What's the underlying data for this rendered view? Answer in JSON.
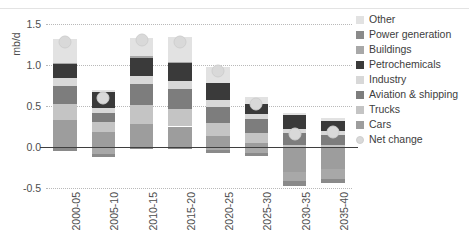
{
  "chart_data": {
    "type": "bar",
    "title": "",
    "subtitle": "",
    "xlabel": "",
    "ylabel": "mb/d",
    "ylim": [
      -0.5,
      1.5
    ],
    "yticks": [
      "1.5",
      "1.0",
      "0.5",
      "0.0",
      "-0.5"
    ],
    "ytick_values": [
      1.5,
      1.0,
      0.5,
      0.0,
      -0.5
    ],
    "grid": true,
    "stacked": true,
    "legend_position": "right",
    "categories": [
      "2000-05",
      "2005-10",
      "2010-15",
      "2015-20",
      "2020-25",
      "2025-30",
      "2030-35",
      "2035-40"
    ],
    "series": [
      {
        "name": "Cars",
        "color": "#9d9d9d",
        "values": [
          0.33,
          0.18,
          0.28,
          0.25,
          0.13,
          0.05,
          -0.3,
          -0.27
        ]
      },
      {
        "name": "Trucks",
        "color": "#c4c4c4",
        "values": [
          0.2,
          0.13,
          0.23,
          0.21,
          0.16,
          0.12,
          0.02,
          0.02
        ]
      },
      {
        "name": "Aviation & shipping",
        "color": "#7d7d7d",
        "values": [
          0.21,
          0.1,
          0.26,
          0.25,
          0.2,
          0.17,
          0.15,
          0.13
        ]
      },
      {
        "name": "Industry",
        "color": "#d8d8d8",
        "values": [
          0.1,
          0.07,
          0.1,
          0.09,
          0.08,
          0.06,
          0.05,
          0.04
        ]
      },
      {
        "name": "Petrochemicals",
        "color": "#3a3a3a",
        "values": [
          0.17,
          0.19,
          0.22,
          0.22,
          0.21,
          0.13,
          0.17,
          0.13
        ]
      },
      {
        "name": "Buildings",
        "color": "#a8a8a8",
        "values": [
          0.02,
          -0.08,
          0.02,
          0.02,
          -0.04,
          -0.07,
          -0.12,
          -0.12
        ]
      },
      {
        "name": "Power generation",
        "color": "#8a8a8a",
        "values": [
          -0.05,
          -0.04,
          -0.03,
          -0.02,
          -0.03,
          -0.04,
          -0.06,
          -0.05
        ]
      },
      {
        "name": "Other",
        "color": "#e2e2e2",
        "values": [
          0.29,
          0.02,
          0.22,
          0.3,
          0.2,
          0.08,
          0.03,
          0.03
        ]
      }
    ],
    "net_change": {
      "name": "Net change",
      "color": "#d9d9d9",
      "values": [
        1.28,
        0.6,
        1.3,
        1.28,
        0.93,
        0.53,
        0.16,
        0.18
      ]
    },
    "negative_totals": [
      -0.05,
      -0.12,
      -0.03,
      -0.02,
      -0.07,
      -0.11,
      -0.48,
      -0.44
    ]
  },
  "legend": {
    "items": [
      {
        "label": "Other",
        "swatch": "legend-swatch-other"
      },
      {
        "label": "Power generation",
        "swatch": "legend-swatch-power-generation"
      },
      {
        "label": "Buildings",
        "swatch": "legend-swatch-buildings"
      },
      {
        "label": "Petrochemicals",
        "swatch": "legend-swatch-petrochemicals"
      },
      {
        "label": "Industry",
        "swatch": "legend-swatch-industry"
      },
      {
        "label": "Aviation & shipping",
        "swatch": "legend-swatch-aviation-shipping"
      },
      {
        "label": "Trucks",
        "swatch": "legend-swatch-trucks"
      },
      {
        "label": "Cars",
        "swatch": "legend-swatch-cars"
      },
      {
        "label": "Net change",
        "swatch": "legend-marker-net-change"
      }
    ]
  },
  "axis": {
    "y_label": "mb/d"
  }
}
